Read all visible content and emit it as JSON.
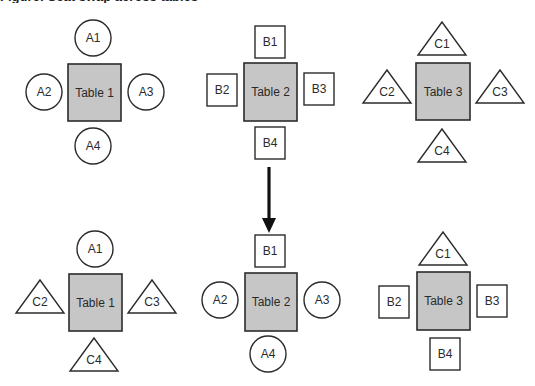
{
  "caption": {
    "text": "Figure: Seat swap across tables"
  },
  "colors": {
    "table_fill": "#c6c6c6",
    "stroke": "#2b2b2b",
    "seat_fill": "#ffffff",
    "background": "#ffffff"
  },
  "arrow": {
    "direction": "down",
    "x": 269,
    "y1": 167,
    "y2": 233
  },
  "before": {
    "tables": [
      {
        "label": "Table 1",
        "rect": [
          68,
          64,
          53,
          57
        ],
        "seats": [
          {
            "label": "A1",
            "shape": "circle",
            "cx": 93,
            "cy": 38
          },
          {
            "label": "A2",
            "shape": "circle",
            "cx": 44,
            "cy": 92
          },
          {
            "label": "A3",
            "shape": "circle",
            "cx": 146,
            "cy": 92
          },
          {
            "label": "A4",
            "shape": "circle",
            "cx": 93,
            "cy": 146
          }
        ]
      },
      {
        "label": "Table 2",
        "rect": [
          244,
          63,
          53,
          58
        ],
        "seats": [
          {
            "label": "B1",
            "shape": "square",
            "cx": 270,
            "cy": 42
          },
          {
            "label": "B2",
            "shape": "square",
            "cx": 222,
            "cy": 90
          },
          {
            "label": "B3",
            "shape": "square",
            "cx": 319,
            "cy": 89
          },
          {
            "label": "B4",
            "shape": "square",
            "cx": 270,
            "cy": 143
          }
        ]
      },
      {
        "label": "Table 3",
        "rect": [
          416,
          63,
          54,
          57
        ],
        "seats": [
          {
            "label": "C1",
            "shape": "triangle",
            "cx": 442,
            "cy": 22
          },
          {
            "label": "C2",
            "shape": "triangle",
            "cx": 387,
            "cy": 70
          },
          {
            "label": "C3",
            "shape": "triangle",
            "cx": 500,
            "cy": 70
          },
          {
            "label": "C4",
            "shape": "triangle",
            "cx": 442,
            "cy": 129
          }
        ]
      }
    ]
  },
  "after": {
    "tables": [
      {
        "label": "Table 1",
        "rect": [
          69,
          274,
          53,
          57
        ],
        "seats": [
          {
            "label": "A1",
            "shape": "circle",
            "cx": 95,
            "cy": 249
          },
          {
            "label": "C2",
            "shape": "triangle",
            "cx": 40,
            "cy": 280
          },
          {
            "label": "C3",
            "shape": "triangle",
            "cx": 152,
            "cy": 280
          },
          {
            "label": "C4",
            "shape": "triangle",
            "cx": 94,
            "cy": 338
          }
        ]
      },
      {
        "label": "Table 2",
        "rect": [
          245,
          273,
          52,
          58
        ],
        "seats": [
          {
            "label": "B1",
            "shape": "square",
            "cx": 270,
            "cy": 251
          },
          {
            "label": "A2",
            "shape": "circle",
            "cx": 220,
            "cy": 300
          },
          {
            "label": "A3",
            "shape": "circle",
            "cx": 322,
            "cy": 300
          },
          {
            "label": "A4",
            "shape": "circle",
            "cx": 268,
            "cy": 354
          }
        ]
      },
      {
        "label": "Table 3",
        "rect": [
          417,
          272,
          53,
          58
        ],
        "seats": [
          {
            "label": "C1",
            "shape": "triangle",
            "cx": 443,
            "cy": 232
          },
          {
            "label": "B2",
            "shape": "square",
            "cx": 394,
            "cy": 302
          },
          {
            "label": "B3",
            "shape": "square",
            "cx": 492,
            "cy": 301
          },
          {
            "label": "B4",
            "shape": "square",
            "cx": 445,
            "cy": 354
          }
        ]
      }
    ]
  }
}
